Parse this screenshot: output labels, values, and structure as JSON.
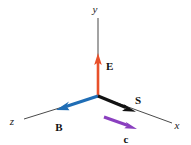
{
  "figure": {
    "background_color": "#ffffff",
    "width": 191,
    "height": 145,
    "origin": {
      "x": 98,
      "y": 96
    }
  },
  "axes": {
    "color": "#4a4a4a",
    "items": [
      {
        "id": "y-axis",
        "label": "y",
        "label_x": 95,
        "label_y": 13,
        "line": {
          "x1": 98,
          "y1": 96,
          "x2": 98,
          "y2": 18
        }
      },
      {
        "id": "x-axis",
        "label": "x",
        "label_x": 177,
        "label_y": 129,
        "line": {
          "x1": 98,
          "y1": 96,
          "x2": 172,
          "y2": 123
        }
      },
      {
        "id": "z-axis",
        "label": "z",
        "label_x": 12,
        "label_y": 125,
        "line": {
          "x1": 98,
          "y1": 96,
          "x2": 24,
          "y2": 119
        }
      }
    ]
  },
  "vectors": [
    {
      "id": "E",
      "label": "E",
      "meaning": "electric-field-vector",
      "color": "#e8502a",
      "label_x": 106,
      "label_y": 69,
      "line": {
        "x1": 98,
        "y1": 96,
        "x2": 98,
        "y2": 58
      },
      "width": 2.6
    },
    {
      "id": "B",
      "label": "B",
      "meaning": "magnetic-field-vector",
      "color": "#1f6db5",
      "label_x": 58,
      "label_y": 130,
      "line": {
        "x1": 98,
        "y1": 96,
        "x2": 58,
        "y2": 109
      },
      "width": 3.0
    },
    {
      "id": "S",
      "label": "S",
      "meaning": "poynting-vector",
      "color": "#121212",
      "label_x": 137,
      "label_y": 104,
      "line": {
        "x1": 98,
        "y1": 96,
        "x2": 134,
        "y2": 111
      },
      "width": 3.0
    },
    {
      "id": "c",
      "label": "c",
      "meaning": "propagation-speed-vector",
      "color": "#8a3fbf",
      "label_x": 126,
      "label_y": 142,
      "line": {
        "x1": 104,
        "y1": 117,
        "x2": 135,
        "y2": 128
      },
      "width": 2.8
    }
  ]
}
